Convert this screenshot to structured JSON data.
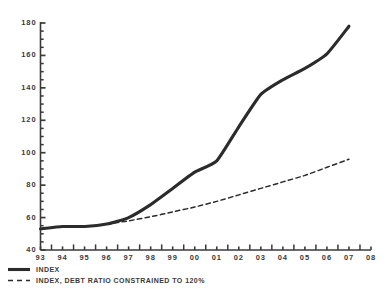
{
  "chart_data": {
    "type": "line",
    "title": "",
    "subtitle": "",
    "xlabel": "",
    "ylabel": "",
    "xlim": [
      1993,
      2008
    ],
    "ylim": [
      40,
      180
    ],
    "y_ticks": [
      40,
      60,
      80,
      100,
      120,
      140,
      160,
      180
    ],
    "y_tick_labels": [
      "40",
      "60",
      "80",
      "100",
      "120",
      "140",
      "160",
      "180"
    ],
    "y_minor_tick_step": 5,
    "x_ticks": [
      1993,
      1994,
      1995,
      1996,
      1997,
      1998,
      1999,
      2000,
      2001,
      2002,
      2003,
      2004,
      2005,
      2006,
      2007,
      2008
    ],
    "x_tick_labels": [
      "93",
      "94",
      "95",
      "96",
      "97",
      "98",
      "99",
      "00",
      "01",
      "02",
      "03",
      "04",
      "05",
      "06",
      "07",
      "08"
    ],
    "grid": false,
    "legend_position": "below-left",
    "line_color": "#2b2b2b",
    "axis_color": "#3a3a3a",
    "background_color": "#ffffff",
    "series": [
      {
        "name": "INDEX",
        "style": "solid",
        "width": 3.1,
        "x": [
          1993,
          1994,
          1995,
          1996,
          1997,
          1998,
          1999,
          2000,
          2001,
          2002,
          2003,
          2004,
          2005,
          2006,
          2007
        ],
        "values": [
          53,
          54.5,
          54.5,
          56,
          60,
          68,
          78,
          88,
          95,
          116,
          136,
          145,
          152,
          161,
          178
        ]
      },
      {
        "name": "INDEX, DEBT RATIO CONSTRAINED TO 120%",
        "style": "dashed",
        "width": 1.5,
        "x": [
          1996,
          1997,
          1998,
          1999,
          2000,
          2001,
          2002,
          2003,
          2004,
          2005,
          2006,
          2007
        ],
        "values": [
          56,
          58,
          60.5,
          63.5,
          66.5,
          70,
          74,
          78,
          82,
          86,
          91,
          96
        ]
      }
    ],
    "legend_entries": [
      {
        "label": "INDEX",
        "style": "solid"
      },
      {
        "label": "INDEX, DEBT RATIO CONSTRAINED TO 120%",
        "style": "dashed"
      }
    ]
  }
}
